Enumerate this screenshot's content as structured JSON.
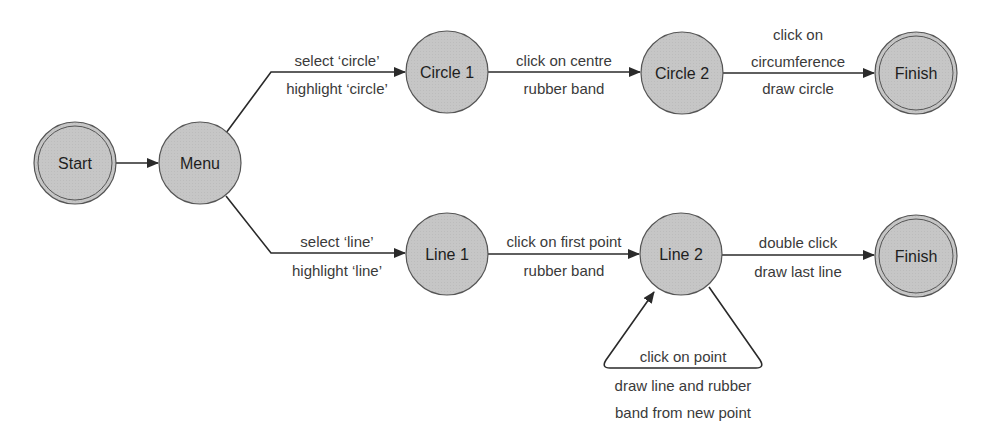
{
  "diagram": {
    "type": "state-transition",
    "colors": {
      "node_fill": "#c4c4c4",
      "node_stroke": "#555555",
      "edge": "#2a2a2a",
      "text": "#1e1e1e",
      "background": "#ffffff"
    },
    "nodes": [
      {
        "id": "start",
        "label": "Start",
        "kind": "initial",
        "cx": 75,
        "cy": 163
      },
      {
        "id": "menu",
        "label": "Menu",
        "kind": "state",
        "cx": 200,
        "cy": 163
      },
      {
        "id": "circle1",
        "label": "Circle 1",
        "kind": "state",
        "cx": 447,
        "cy": 72
      },
      {
        "id": "circle2",
        "label": "Circle 2",
        "kind": "state",
        "cx": 682,
        "cy": 73
      },
      {
        "id": "finish_circle",
        "label": "Finish",
        "kind": "final",
        "cx": 916,
        "cy": 73
      },
      {
        "id": "line1",
        "label": "Line 1",
        "kind": "state",
        "cx": 447,
        "cy": 254
      },
      {
        "id": "line2",
        "label": "Line 2",
        "kind": "state",
        "cx": 681,
        "cy": 254
      },
      {
        "id": "finish_line",
        "label": "Finish",
        "kind": "final",
        "cx": 916,
        "cy": 256
      }
    ],
    "edges": [
      {
        "from": "start",
        "to": "menu",
        "event": "",
        "action": ""
      },
      {
        "from": "menu",
        "to": "circle1",
        "event": "select ‘circle’",
        "action": "highlight ‘circle’"
      },
      {
        "from": "circle1",
        "to": "circle2",
        "event": "click on centre",
        "action": "rubber band"
      },
      {
        "from": "circle2",
        "to": "finish_circle",
        "event": "click on circumference",
        "event_lines": [
          "click on",
          "circumference"
        ],
        "action": "draw circle"
      },
      {
        "from": "menu",
        "to": "line1",
        "event": "select ‘line’",
        "action": "highlight ‘line’"
      },
      {
        "from": "line1",
        "to": "line2",
        "event": "click on first point",
        "action": "rubber band"
      },
      {
        "from": "line2",
        "to": "finish_line",
        "event": "double click",
        "action": "draw last line"
      },
      {
        "from": "line2",
        "to": "line2",
        "event": "click on point",
        "action": "draw line and rubber band from new point",
        "action_lines": [
          "draw line and rubber",
          "band from new point"
        ]
      }
    ]
  }
}
